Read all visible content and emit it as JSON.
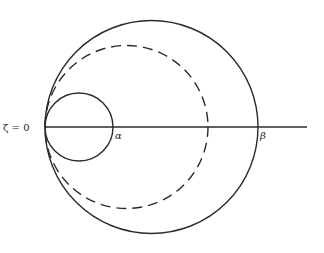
{
  "diagram": {
    "labels": {
      "origin": "ζ = 0",
      "alpha": "α",
      "beta": "β"
    },
    "geometry": {
      "axis": {
        "x1": 45,
        "x2": 307,
        "y": 127
      },
      "outer_circle": {
        "cx": 151.5,
        "cy": 127,
        "r": 106.5,
        "style": "solid"
      },
      "dashed_circle": {
        "cx": 126.5,
        "cy": 127,
        "r": 81.5,
        "style": "dashed"
      },
      "inner_circle": {
        "cx": 79,
        "cy": 127,
        "r": 34,
        "style": "solid"
      }
    },
    "colors": {
      "stroke": "#2a2a2a",
      "background": "#ffffff"
    }
  }
}
